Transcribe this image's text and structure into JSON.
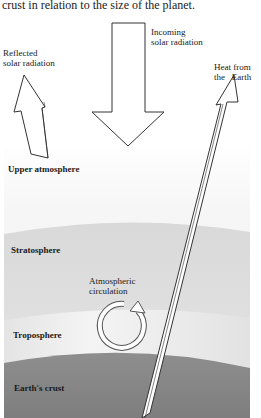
{
  "caption": "crust in relation to the size of the planet.",
  "labels": {
    "incoming_line1": "Incoming",
    "incoming_line2": "solar radiation",
    "reflected_line1": "Reflected",
    "reflected_line2": "solar radiation",
    "heat_line1": "Heat from",
    "heat_line2": "the   Earth",
    "upper_atmosphere": "Upper atmosphere",
    "stratosphere": "Stratosphere",
    "circulation_line1": "Atmospheric",
    "circulation_line2": "circulation",
    "troposphere": "Troposphere",
    "crust": "Earth's crust"
  },
  "colors": {
    "upper_atmosphere": "#f4f4f4",
    "stratosphere": "#dcdcdc",
    "troposphere": "#e8e8e8",
    "crust": "#8a8a8a",
    "arrow_fill": "#ffffff",
    "arrow_stroke": "#333333"
  }
}
